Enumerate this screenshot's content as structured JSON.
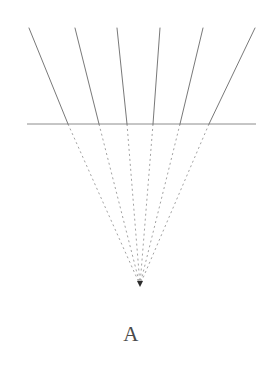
{
  "figure": {
    "caption": "A",
    "background_color": "#ffffff",
    "solid_line_color": "#555555",
    "dashed_line_color": "#8a8a8a",
    "horizon_line_color": "#6f6f6f",
    "marker_color": "#2b2b2b",
    "line_width": 0.8,
    "dash_pattern": "2,3",
    "horizon": {
      "label": "horizon-line",
      "y": 124,
      "x_start": 27,
      "x_end": 256
    },
    "vanishing_point": {
      "label": "vanishing-point",
      "x": 140,
      "y": 285,
      "marker": "triangle-down"
    },
    "rays": [
      {
        "name": "ray-1",
        "top_x": 29,
        "top_y": 28,
        "horizon_x": 68
      },
      {
        "name": "ray-2",
        "top_x": 75,
        "top_y": 28,
        "horizon_x": 99
      },
      {
        "name": "ray-3",
        "top_x": 117,
        "top_y": 28,
        "horizon_x": 127
      },
      {
        "name": "ray-4",
        "top_x": 160,
        "top_y": 28,
        "horizon_x": 153
      },
      {
        "name": "ray-5",
        "top_x": 203,
        "top_y": 28,
        "horizon_x": 180
      },
      {
        "name": "ray-6",
        "top_x": 255,
        "top_y": 28,
        "horizon_x": 209
      }
    ],
    "ray_count": 6
  }
}
